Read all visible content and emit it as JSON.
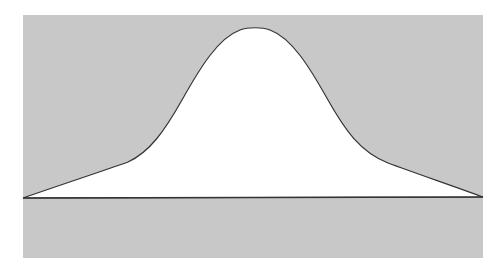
{
  "figure": {
    "colors": {
      "page_background": "#ffffff",
      "panel_fill": "#c8c8c8",
      "curve_fill": "#ffffff",
      "stroke": "#333333"
    },
    "panel": {
      "x": 23,
      "y": 15,
      "width": 460,
      "height": 243
    },
    "baseline": {
      "x1": 23,
      "y1": 198,
      "x2": 483,
      "y2": 197
    },
    "curve_path": "M23,198 C60,185 100,172 128,162 C150,152 165,130 182,100 C200,68 218,38 240,30 C248,27 262,27 270,30 C292,38 310,68 328,100 C345,130 360,152 388,163 C415,173 450,185 483,197 Z"
  }
}
